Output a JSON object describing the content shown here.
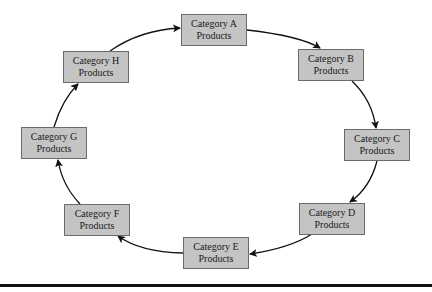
{
  "diagram": {
    "type": "cycle",
    "direction": "clockwise",
    "nodes": [
      {
        "id": "A",
        "line1": "Category A",
        "line2": "Products",
        "x": 181,
        "y": 14
      },
      {
        "id": "B",
        "line1": "Category B",
        "line2": "Products",
        "x": 298,
        "y": 49
      },
      {
        "id": "C",
        "line1": "Category C",
        "line2": "Products",
        "x": 344,
        "y": 129
      },
      {
        "id": "D",
        "line1": "Category D",
        "line2": "Products",
        "x": 299,
        "y": 203
      },
      {
        "id": "E",
        "line1": "Category E",
        "line2": "Products",
        "x": 183,
        "y": 237
      },
      {
        "id": "F",
        "line1": "Category F",
        "line2": "Products",
        "x": 64,
        "y": 204
      },
      {
        "id": "G",
        "line1": "Category G",
        "line2": "Products",
        "x": 21,
        "y": 127
      },
      {
        "id": "H",
        "line1": "Category H",
        "line2": "Products",
        "x": 63,
        "y": 51
      }
    ],
    "edges": [
      [
        "A",
        "B"
      ],
      [
        "B",
        "C"
      ],
      [
        "C",
        "D"
      ],
      [
        "D",
        "E"
      ],
      [
        "E",
        "F"
      ],
      [
        "F",
        "G"
      ],
      [
        "G",
        "H"
      ],
      [
        "H",
        "A"
      ]
    ],
    "colors": {
      "box_fill": "#c4c4c4",
      "box_border": "#6a6a6a",
      "arrow": "#111111"
    }
  }
}
